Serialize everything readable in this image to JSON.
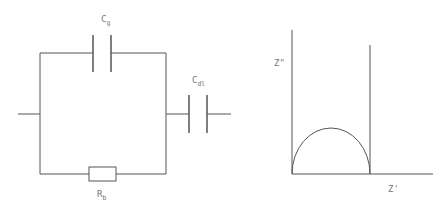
{
  "circuit": {
    "labels": {
      "cg": {
        "main": "C",
        "sub": "g"
      },
      "cdl": {
        "main": "C",
        "sub": "dl"
      },
      "rb": {
        "main": "R",
        "sub": "b"
      }
    }
  },
  "plot": {
    "y_axis_label": "Z\"",
    "x_axis_label": "Z'"
  },
  "colors": {
    "line": "#555555",
    "text": "#777777",
    "background": "#ffffff"
  }
}
